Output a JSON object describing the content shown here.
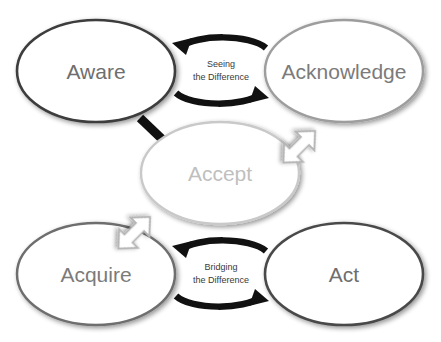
{
  "diagram": {
    "background_color": "#ffffff",
    "nodes": [
      {
        "id": "aware",
        "label": "Aware",
        "position": "top-left",
        "cx": 96,
        "cy": 71,
        "rx": 79,
        "ry": 51,
        "outline_color": "#3d3d3d",
        "outline_width": 2.6,
        "fill_color": "#ffffff",
        "text_color": "#6e6e6e",
        "font_size": 21
      },
      {
        "id": "acknowledge",
        "label": "Acknowledge",
        "position": "top-right",
        "cx": 344,
        "cy": 71,
        "rx": 79,
        "ry": 51,
        "outline_color": "#9d9d9d",
        "outline_width": 2.4,
        "fill_color": "#ffffff",
        "text_color": "#7b7b7b",
        "font_size": 21
      },
      {
        "id": "accept",
        "label": "Accept",
        "position": "center",
        "cx": 220,
        "cy": 173,
        "rx": 79,
        "ry": 51,
        "outline_color": "#c9c9c9",
        "outline_width": 2.4,
        "fill_color": "#ffffff",
        "text_color": "#bfbfbf",
        "font_size": 21
      },
      {
        "id": "acquire",
        "label": "Acquire",
        "position": "bottom-left",
        "cx": 96,
        "cy": 274,
        "rx": 79,
        "ry": 51,
        "outline_color": "#6e6e6e",
        "outline_width": 2.5,
        "fill_color": "#ffffff",
        "text_color": "#7b7b7b",
        "font_size": 21
      },
      {
        "id": "act",
        "label": "Act",
        "position": "bottom-right",
        "cx": 344,
        "cy": 274,
        "rx": 79,
        "ry": 51,
        "outline_color": "#4a4a4a",
        "outline_width": 2.6,
        "fill_color": "#ffffff",
        "text_color": "#6e6e6e",
        "font_size": 21
      }
    ],
    "connectors": [
      {
        "id": "seeing",
        "label_line1": "Seeing",
        "label_line2": "the Difference",
        "from": "aware",
        "to": "acknowledge",
        "style": "double-curved-black-arrow",
        "color": "#111111",
        "text_color": "#3a3a3a",
        "font_size": 9,
        "label_cx": 221,
        "label_cy": 70
      },
      {
        "id": "bridging",
        "label_line1": "Bridging",
        "label_line2": "the Difference",
        "from": "acquire",
        "to": "act",
        "style": "double-curved-black-arrow",
        "color": "#111111",
        "text_color": "#3a3a3a",
        "font_size": 9,
        "label_cx": 221,
        "label_cy": 273
      },
      {
        "id": "acknowledge-to-accept",
        "label": "",
        "from": "acknowledge",
        "to": "accept",
        "style": "hollow-block-arrow",
        "direction": "down-left",
        "outline_color": "#b5b5b5",
        "fill_color": "#ffffff"
      },
      {
        "id": "accept-to-acquire",
        "label": "",
        "from": "accept",
        "to": "acquire",
        "style": "hollow-block-arrow",
        "direction": "down-left",
        "outline_color": "#b5b5b5",
        "fill_color": "#ffffff"
      },
      {
        "id": "aware-to-accept",
        "label": "",
        "from": "aware",
        "to": "accept",
        "style": "short-black-stub",
        "color": "#111111"
      }
    ]
  }
}
